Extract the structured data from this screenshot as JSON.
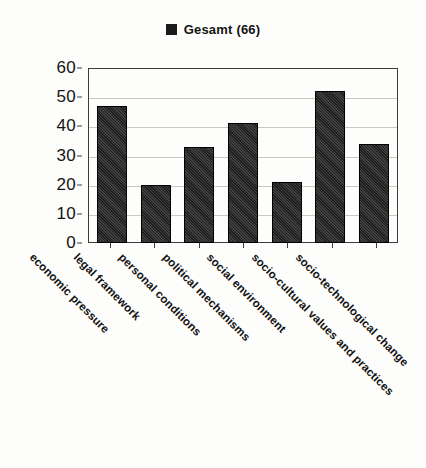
{
  "legend": {
    "swatch_color": "#1b1b1b",
    "label": "Gesamt (66)"
  },
  "axes": {
    "y_ticks": [
      "60",
      "50",
      "40",
      "30",
      "20",
      "10",
      "0"
    ]
  },
  "chart_data": {
    "type": "bar",
    "title": "",
    "subtitle": "",
    "xlabel": "",
    "ylabel": "",
    "ylim": [
      0,
      60
    ],
    "ytick_step": 10,
    "grid": true,
    "legend_position": "top-center",
    "bar_color": "#1e1e1e",
    "series": [
      {
        "name": "Gesamt (66)",
        "values": [
          47,
          20,
          33,
          41,
          21,
          52,
          34
        ]
      }
    ],
    "categories": [
      "economic pressure",
      "legal framework",
      "personal conditions",
      "political mechanisms",
      "social environment",
      "socio-cultural values and practices",
      "socio-technological change"
    ]
  }
}
